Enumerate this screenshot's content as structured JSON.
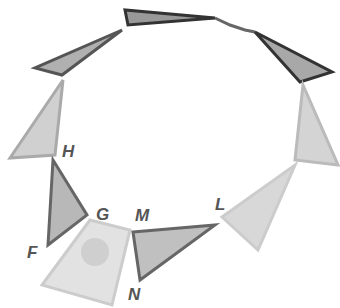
{
  "figure": {
    "labels": [
      {
        "id": "H",
        "text": "H",
        "x": 62,
        "y": 144
      },
      {
        "id": "G",
        "text": "G",
        "x": 96,
        "y": 207
      },
      {
        "id": "F",
        "text": "F",
        "x": 27,
        "y": 245
      },
      {
        "id": "M",
        "text": "M",
        "x": 135,
        "y": 208
      },
      {
        "id": "N",
        "text": "N",
        "x": 128,
        "y": 287
      },
      {
        "id": "L",
        "text": "L",
        "x": 215,
        "y": 197
      }
    ],
    "colors": {
      "frame": "#5a5a5a",
      "fill": "#b8b8b8",
      "light_fill": "#dcdcdc",
      "label": "#555555"
    }
  }
}
